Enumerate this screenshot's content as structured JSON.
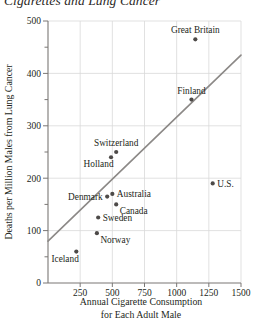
{
  "chart_data": {
    "type": "scatter",
    "title": "Cigarettes and Lung Cancer",
    "xlabel_line1": "Annual Cigarette Consumption",
    "xlabel_line2": "for Each Adult Male",
    "ylabel": "Deaths per Million Males from Lung Cancer",
    "xlim": [
      0,
      1500
    ],
    "ylim": [
      0,
      500
    ],
    "xticks": [
      250,
      500,
      750,
      1000,
      1250,
      1500
    ],
    "ytick_labels": [
      "0",
      "100",
      "200",
      "300",
      "400",
      "500"
    ],
    "yticks": [
      0,
      100,
      200,
      300,
      400,
      500
    ],
    "y_minor_ticks": [
      50,
      150,
      250,
      350,
      450
    ],
    "grid": true,
    "legend": "none",
    "points": [
      {
        "label": "Iceland",
        "x": 220,
        "y": 60,
        "label_pos": "below-left"
      },
      {
        "label": "Norway",
        "x": 380,
        "y": 95,
        "label_pos": "below-right"
      },
      {
        "label": "Sweden",
        "x": 390,
        "y": 125,
        "label_pos": "right"
      },
      {
        "label": "Denmark",
        "x": 460,
        "y": 165,
        "label_pos": "left"
      },
      {
        "label": "Australia",
        "x": 500,
        "y": 170,
        "label_pos": "right"
      },
      {
        "label": "Canada",
        "x": 530,
        "y": 150,
        "label_pos": "below-right"
      },
      {
        "label": "Holland",
        "x": 490,
        "y": 240,
        "label_pos": "below-left"
      },
      {
        "label": "Switzerland",
        "x": 530,
        "y": 250,
        "label_pos": "above"
      },
      {
        "label": "Finland",
        "x": 1115,
        "y": 350,
        "label_pos": "above"
      },
      {
        "label": "Great Britain",
        "x": 1145,
        "y": 465,
        "label_pos": "above"
      },
      {
        "label": "U.S.",
        "x": 1280,
        "y": 190,
        "label_pos": "right"
      }
    ],
    "trendline": {
      "x0": 0,
      "y0": 80,
      "x1": 1500,
      "y1": 435
    }
  }
}
